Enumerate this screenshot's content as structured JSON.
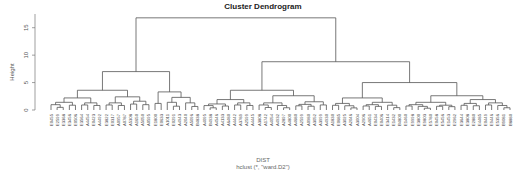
{
  "chart_data": {
    "type": "dendrogram",
    "title": "Cluster Dendrogram",
    "ylabel": "Height",
    "xlabel": "DIST",
    "sub": "hclust (*, \"ward.D2\")",
    "ylim": [
      0,
      17.5
    ],
    "yticks": [
      0,
      5,
      10,
      15
    ],
    "grid": false,
    "leaf_labels_note": "Best-effort transcription of tiny rotated labels; several may be misread (e.g., duplicate A2599).",
    "leaf_labels": [
      "E0455",
      "E2599",
      "E3368",
      "E3456",
      "E0506",
      "E3564",
      "A4454",
      "E0423",
      "A4492",
      "E3822",
      "E0317",
      "A0957",
      "A0787",
      "A5308",
      "A1650",
      "A5050",
      "A0595",
      "E1800",
      "E0633",
      "A1011",
      "E0291",
      "A4943",
      "A2040",
      "A5096",
      "B4838",
      "A4095",
      "B4938",
      "A4546",
      "A4133",
      "A6480",
      "A4442",
      "A3789",
      "A2599",
      "A4445",
      "A3808",
      "A1742",
      "A4054",
      "A4932",
      "A2897",
      "A4800",
      "A4680",
      "A2599",
      "A0980",
      "A3052",
      "A3999",
      "A4930",
      "A1830",
      "E0685",
      "A3025",
      "A2046",
      "A3004",
      "A2906",
      "A4651",
      "E0434",
      "E0406",
      "E3414",
      "E1432",
      "B4800",
      "E1460",
      "E9998",
      "E3800",
      "E9803",
      "E5780",
      "E0458",
      "E5456",
      "E1453",
      "E2962",
      "E3644",
      "E3808",
      "E2880",
      "E4485",
      "E0449",
      "E9446",
      "E5356",
      "B9081",
      "B8880"
    ],
    "merges_major": [
      {
        "name": "root",
        "height": 16.8
      },
      {
        "name": "left-cluster",
        "height": 7.0
      },
      {
        "name": "right-cluster",
        "height": 8.8
      },
      {
        "name": "right-left-sub",
        "height": 3.5
      },
      {
        "name": "right-right-sub",
        "height": 5.0
      }
    ]
  }
}
